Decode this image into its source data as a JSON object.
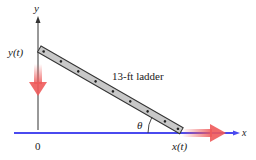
{
  "figure": {
    "ladder_label": "13-ft ladder",
    "y_axis_label": "y",
    "x_axis_label": "x",
    "y_position_label": "y(t)",
    "x_position_label": "x(t)",
    "origin_label": "0",
    "angle_label": "θ"
  },
  "colors": {
    "ground": "#4a4aef",
    "arrow": "#ee5a5a",
    "ladder_fill": "#c8c8c8",
    "ladder_stroke": "#333333",
    "axis": "#333333"
  }
}
